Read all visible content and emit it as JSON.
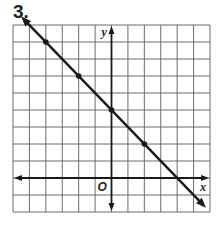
{
  "problem": {
    "number": "3."
  },
  "colors": {
    "grid": "#6b6b6b",
    "axis": "#1a1a1a",
    "line": "#1a1a1a",
    "point": "#1a1a1a",
    "text": "#222222"
  },
  "axes": {
    "x_label": "x",
    "y_label": "y",
    "origin_label": "O"
  },
  "chart_data": {
    "type": "line",
    "title": "3.",
    "xlabel": "x",
    "ylabel": "y",
    "xlim": [
      -6,
      6
    ],
    "ylim": [
      -2,
      9
    ],
    "grid": true,
    "tick_labels": false,
    "series": [
      {
        "name": "line",
        "equation": "y = -x + 4",
        "slope": -1,
        "y_intercept": 4,
        "x_intercept": 4,
        "points": [
          {
            "x": -4,
            "y": 8
          },
          {
            "x": -2,
            "y": 6
          },
          {
            "x": 0,
            "y": 4
          },
          {
            "x": 2,
            "y": 2
          }
        ],
        "arrows": "both ends"
      }
    ]
  }
}
